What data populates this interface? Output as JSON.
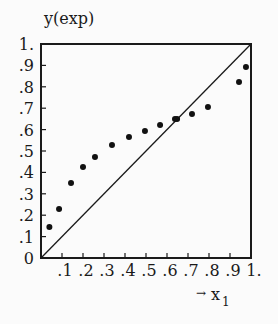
{
  "chart_data": {
    "type": "scatter",
    "title": "",
    "xlabel": "→ x₁",
    "ylabel": "y(exp)",
    "xlim": [
      0,
      1
    ],
    "ylim": [
      0,
      1
    ],
    "grid": false,
    "legend": null,
    "x_ticks": [
      ".1",
      ".2",
      ".3",
      ".4",
      ".5",
      ".6",
      ".7",
      ".8",
      ".9",
      "1."
    ],
    "y_ticks": [
      "0",
      ".1",
      ".2",
      ".3",
      ".4",
      ".5",
      ".6",
      ".7",
      ".8",
      ".9",
      "1."
    ],
    "reference_line": {
      "label": "diagonal y = x",
      "from": [
        0,
        0
      ],
      "to": [
        1,
        1
      ]
    },
    "series": [
      {
        "name": "experimental points",
        "x": [
          0.04,
          0.086,
          0.143,
          0.2,
          0.257,
          0.338,
          0.419,
          0.495,
          0.567,
          0.638,
          0.648,
          0.719,
          0.795,
          0.943,
          0.976
        ],
        "y": [
          0.145,
          0.229,
          0.35,
          0.425,
          0.472,
          0.528,
          0.565,
          0.593,
          0.621,
          0.65,
          0.65,
          0.673,
          0.706,
          0.822,
          0.893
        ]
      }
    ]
  },
  "labels": {
    "y_axis_title": "y(exp)",
    "x_axis_arrow": "→",
    "x_axis_var": "x",
    "x_axis_sub": "1"
  }
}
